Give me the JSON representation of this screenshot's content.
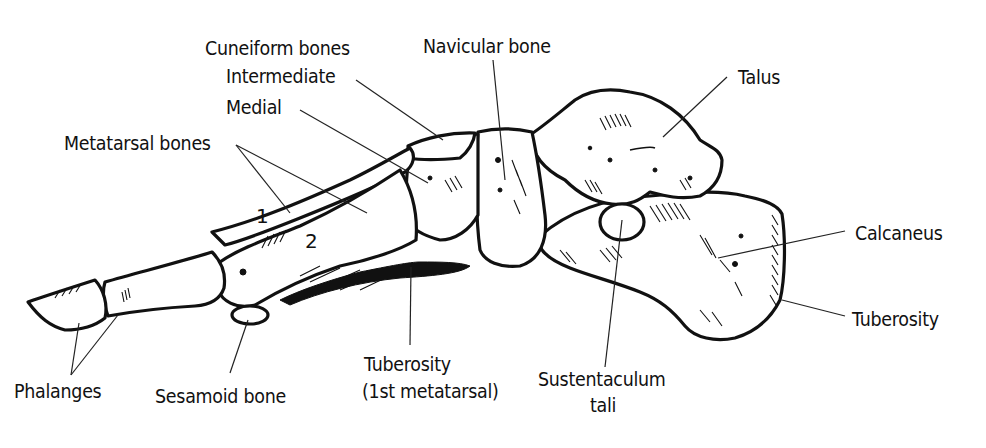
{
  "diagram": {
    "labels": {
      "cuneiform_bones": "Cuneiform bones",
      "intermediate": "Intermediate",
      "medial": "Medial",
      "navicular_bone": "Navicular bone",
      "talus": "Talus",
      "metatarsal_bones": "Metatarsal bones",
      "calcaneus": "Calcaneus",
      "tuberosity_calcaneus": "Tuberosity",
      "phalanges": "Phalanges",
      "sesamoid_bone": "Sesamoid bone",
      "tuberosity_1st_metatarsal_line1": "Tuberosity",
      "tuberosity_1st_metatarsal_line2": "(1st metatarsal)",
      "sustentaculum_line1": "Sustentaculum",
      "sustentaculum_line2": "tali"
    },
    "metatarsal_numbers": [
      "1",
      "2"
    ],
    "colors": {
      "ink": "#111111",
      "background": "#ffffff"
    }
  }
}
